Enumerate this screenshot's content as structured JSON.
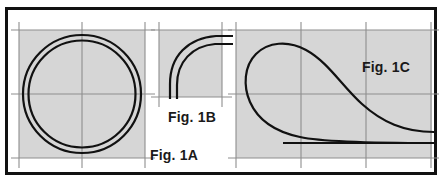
{
  "plate": {
    "title": "Technical line-drawing figure plate",
    "background_color": "#ffffff",
    "border_color": "#111111",
    "border_width_px": 3,
    "panel_fill_color": "#d6d6d6",
    "gridline_color": "#8e8e8e",
    "curve_color": "#111111",
    "curve_width_px": 2.2,
    "width_px": 442,
    "height_px": 182
  },
  "panels": [
    {
      "id": "fig-1a",
      "label": "Fig. 1A",
      "label_position": "outside-bottom-right",
      "description": "Two concentric circles forming a ring / annulus cross-section",
      "box": {
        "x": 19,
        "y": 30,
        "width": 126,
        "height": 128
      },
      "gridlines": {
        "vertical_x": [
          19,
          82,
          145
        ],
        "horizontal_y": [
          30,
          94,
          158
        ],
        "overhang_px": 10
      },
      "geometry": {
        "type": "concentric-circles",
        "center_x": 82,
        "center_y": 94,
        "outer_radius": 59,
        "inner_radius": 54
      }
    },
    {
      "id": "fig-1b",
      "label": "Fig. 1B",
      "label_position": "outside-bottom-center",
      "description": "Two parallel quarter-arc bend curves (elbow), rising from vertical to horizontal",
      "box": {
        "x": 159,
        "y": 30,
        "width": 63,
        "height": 67
      },
      "gridlines": {
        "vertical_x": [
          159,
          222
        ],
        "horizontal_y": [
          30,
          97
        ],
        "overhang_px": 10
      },
      "geometry": {
        "type": "parallel-quarter-arcs",
        "outer_arc": {
          "start_x": 170,
          "start_y": 97,
          "end_x": 232,
          "end_y": 36
        },
        "inner_arc": {
          "start_x": 177,
          "start_y": 97,
          "end_x": 232,
          "end_y": 44
        }
      }
    },
    {
      "id": "fig-1c",
      "label": "Fig. 1C",
      "label_position": "inside-top-right",
      "description": "Teardrop / loop curve with a straight horizontal line near the base",
      "box": {
        "x": 236,
        "y": 30,
        "width": 196,
        "height": 128
      },
      "gridlines": {
        "vertical_x": [
          236,
          301,
          366,
          432
        ],
        "horizontal_y": [
          30,
          94,
          158
        ],
        "overhang_px": 10
      },
      "geometry": {
        "type": "teardrop-loop-with-baseline",
        "apex_x": 301,
        "apex_y": 45,
        "left_bulge_x": 250,
        "tail_end_x": 434,
        "tail_end_y": 132,
        "baseline_y": 143,
        "baseline_start_x": 283,
        "baseline_end_x": 434
      }
    }
  ],
  "labels": {
    "fig_1a": "Fig. 1A",
    "fig_1b": "Fig. 1B",
    "fig_1c": "Fig. 1C"
  }
}
